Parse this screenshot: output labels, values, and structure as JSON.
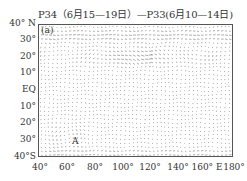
{
  "chart_data": {
    "type": "quiver",
    "title": "P34（6月15—19日）—P33(6月10—14日)",
    "panel_label": "(a)",
    "annotations": [
      {
        "text": "A",
        "lon": 60,
        "lat": -28
      }
    ],
    "xlabel": "",
    "ylabel": "",
    "x_ticks": [
      "40°",
      "60°",
      "80°",
      "100°",
      "120°",
      "140°",
      "160° E",
      "180°"
    ],
    "y_ticks": [
      "40° N",
      "30°",
      "20°",
      "10°",
      "EQ",
      "10°",
      "20°",
      "30°",
      "40°S"
    ],
    "xlim": [
      40,
      180
    ],
    "ylim": [
      -40,
      40
    ],
    "grid": false
  }
}
